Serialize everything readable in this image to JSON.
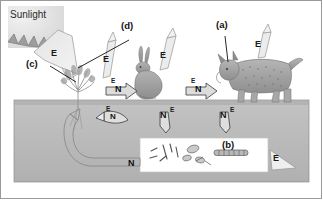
{
  "figure": {
    "title_text": "Sunlight",
    "ground_color": "#b9b9b9",
    "sky_color": "#ffffff",
    "arrow_fill": "#d9d9d9",
    "arrow_stroke": "#4a4a4a",
    "decomposer_box_color": "#ffffff"
  },
  "callouts": [
    {
      "id": "a",
      "label": "(a)",
      "target": "lynx-predator"
    },
    {
      "id": "b",
      "label": "(b)",
      "target": "decomposers"
    },
    {
      "id": "c",
      "label": "(c)",
      "target": "plant-producer"
    },
    {
      "id": "d",
      "label": "(d)",
      "target": "rabbit-herbivore"
    }
  ],
  "organisms": [
    {
      "name": "sun",
      "label": "Sunlight"
    },
    {
      "name": "plant",
      "label": ""
    },
    {
      "name": "rabbit",
      "label": ""
    },
    {
      "name": "lynx",
      "label": ""
    },
    {
      "name": "decomposers",
      "label": ""
    }
  ],
  "flow_labels": {
    "energy": "E",
    "nutrient": "N"
  },
  "arrows": [
    {
      "name": "sunlight-to-plant",
      "letters": [
        "E"
      ],
      "direction": "down-right"
    },
    {
      "name": "plant-energy-loss",
      "letters": [
        "E"
      ],
      "direction": "up"
    },
    {
      "name": "plant-to-rabbit",
      "letters": [
        "E",
        "N"
      ],
      "direction": "right"
    },
    {
      "name": "rabbit-energy-loss",
      "letters": [
        "E"
      ],
      "direction": "up"
    },
    {
      "name": "rabbit-to-lynx",
      "letters": [
        "E",
        "N"
      ],
      "direction": "right"
    },
    {
      "name": "lynx-energy-loss",
      "letters": [
        "E"
      ],
      "direction": "up"
    },
    {
      "name": "plant-to-soil",
      "letters": [
        "E",
        "N"
      ],
      "direction": "down"
    },
    {
      "name": "rabbit-to-decomposers",
      "letters": [
        "N",
        "E"
      ],
      "direction": "down"
    },
    {
      "name": "lynx-to-decomposers",
      "letters": [
        "N",
        "E"
      ],
      "direction": "down"
    },
    {
      "name": "decomposers-energy-loss",
      "letters": [
        "E"
      ],
      "direction": "right"
    },
    {
      "name": "decomposers-to-plant-roots",
      "letters": [
        "N"
      ],
      "direction": "curve-up-left"
    }
  ]
}
